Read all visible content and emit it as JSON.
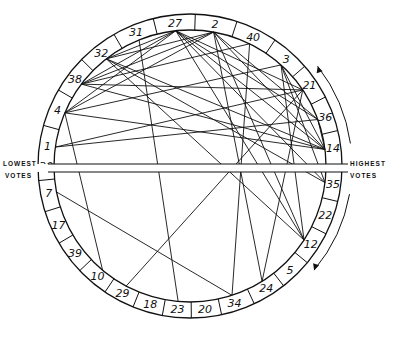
{
  "diagram": {
    "center": [
      190,
      166
    ],
    "outer_radius": 152,
    "inner_radius": 136,
    "label_left_top": "LOWEST",
    "label_left_bottom": "VOTES",
    "label_right_top": "HIGHEST",
    "label_right_bottom": "VOTES",
    "upper_ring_order_left_to_right": [
      "1",
      "4",
      "38",
      "32",
      "31",
      "27",
      "2",
      "40",
      "3",
      "21",
      "36",
      "14"
    ],
    "lower_ring_order_left_to_right": [
      "30",
      "7",
      "17",
      "39",
      "10",
      "29",
      "18",
      "23",
      "20",
      "34",
      "24",
      "5",
      "12",
      "22",
      "35"
    ],
    "segments": [
      {
        "id": "1",
        "angle": 172
      },
      {
        "id": "4",
        "angle": 157
      },
      {
        "id": "38",
        "angle": 143
      },
      {
        "id": "32",
        "angle": 128
      },
      {
        "id": "31",
        "angle": 112
      },
      {
        "id": "27",
        "angle": 96
      },
      {
        "id": "2",
        "angle": 80
      },
      {
        "id": "40",
        "angle": 64
      },
      {
        "id": "3",
        "angle": 48
      },
      {
        "id": "21",
        "angle": 34
      },
      {
        "id": "36",
        "angle": 20
      },
      {
        "id": "14",
        "angle": 7
      },
      {
        "id": "35",
        "angle": -7
      },
      {
        "id": "22",
        "angle": -20
      },
      {
        "id": "12",
        "angle": -33
      },
      {
        "id": "5",
        "angle": -46
      },
      {
        "id": "24",
        "angle": -58
      },
      {
        "id": "34",
        "angle": -72
      },
      {
        "id": "20",
        "angle": -84
      },
      {
        "id": "23",
        "angle": -95
      },
      {
        "id": "18",
        "angle": -106
      },
      {
        "id": "29",
        "angle": -118
      },
      {
        "id": "10",
        "angle": -130
      },
      {
        "id": "39",
        "angle": -143
      },
      {
        "id": "17",
        "angle": -156
      },
      {
        "id": "7",
        "angle": -169
      },
      {
        "id": "30",
        "angle": -180
      }
    ],
    "chords": [
      [
        "27",
        "32"
      ],
      [
        "27",
        "38"
      ],
      [
        "27",
        "4"
      ],
      [
        "27",
        "36"
      ],
      [
        "27",
        "14"
      ],
      [
        "27",
        "21"
      ],
      [
        "27",
        "35"
      ],
      [
        "27",
        "12"
      ],
      [
        "2",
        "38"
      ],
      [
        "2",
        "32"
      ],
      [
        "2",
        "4"
      ],
      [
        "2",
        "14"
      ],
      [
        "2",
        "36"
      ],
      [
        "2",
        "12"
      ],
      [
        "2",
        "24"
      ],
      [
        "40",
        "34"
      ],
      [
        "40",
        "38"
      ],
      [
        "3",
        "14"
      ],
      [
        "3",
        "35"
      ],
      [
        "3",
        "12"
      ],
      [
        "3",
        "4"
      ],
      [
        "21",
        "38"
      ],
      [
        "21",
        "29"
      ],
      [
        "21",
        "24"
      ],
      [
        "21",
        "1"
      ],
      [
        "36",
        "1"
      ],
      [
        "36",
        "14"
      ],
      [
        "14",
        "38"
      ],
      [
        "14",
        "32"
      ],
      [
        "14",
        "4"
      ],
      [
        "31",
        "23"
      ],
      [
        "32",
        "12"
      ],
      [
        "32",
        "35"
      ],
      [
        "4",
        "10"
      ],
      [
        "7",
        "34"
      ]
    ],
    "arrows": {
      "upper": "counterclockwise toward top",
      "lower": "clockwise toward bottom"
    }
  }
}
